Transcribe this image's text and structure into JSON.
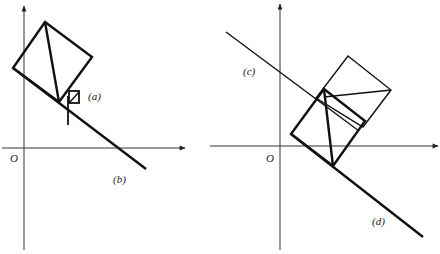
{
  "figure": {
    "left_panel": {
      "origin_label": "O",
      "labels": {
        "a": "(a)",
        "b": "(b)"
      }
    },
    "right_panel": {
      "origin_label": "O",
      "labels": {
        "c": "(c)",
        "d": "(d)"
      }
    },
    "colors": {
      "line": "#111111",
      "axis": "#333333",
      "background": "#ffffff"
    }
  }
}
